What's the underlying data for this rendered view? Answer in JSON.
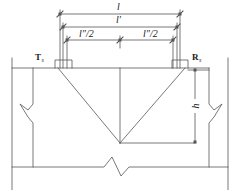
{
  "figure": {
    "type": "engineering-section-diagram",
    "line_color": "#555555",
    "text_color": "#1a1a1a",
    "background": "#ffffff"
  },
  "dimensions": {
    "overall": {
      "label": "l",
      "name": "overall-span"
    },
    "clear": {
      "label": "l′",
      "name": "clear-span"
    },
    "half_left": {
      "label": "l″/2",
      "name": "half-effective-span-left"
    },
    "half_right": {
      "label": "l″/2",
      "name": "half-effective-span-right"
    },
    "depth": {
      "label": "h",
      "name": "section-depth"
    }
  },
  "supports": {
    "left": {
      "symbol": "T",
      "subscript": "s",
      "name": "left-support-reaction"
    },
    "right": {
      "symbol": "R",
      "subscript": "s",
      "name": "right-support-reaction"
    }
  },
  "annotations": {
    "break_symbol": "zigzag-break",
    "crack_pattern": "V-shape",
    "centerline": "vertical-centerline"
  }
}
